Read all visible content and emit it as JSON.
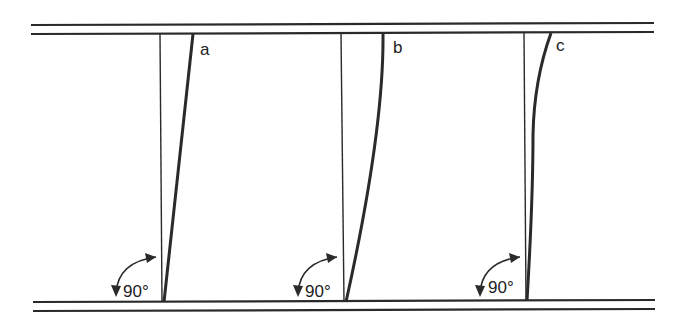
{
  "diagram": {
    "type": "shear deformation illustration",
    "colors": {
      "line": "#2a2a2a",
      "background": "#ffffff"
    },
    "panels": [
      {
        "id": "a",
        "label": "a",
        "angle_label": "90°",
        "deformation": "straight tilt"
      },
      {
        "id": "b",
        "label": "b",
        "angle_label": "90°",
        "deformation": "curved (bending near top)"
      },
      {
        "id": "c",
        "label": "c",
        "angle_label": "90°",
        "deformation": "S-curve / localized near top"
      }
    ]
  }
}
